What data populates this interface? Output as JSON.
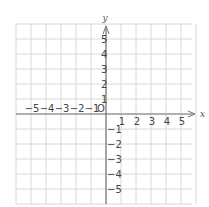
{
  "diagram": {
    "type": "coordinate-plane",
    "axes": {
      "x_label": "x",
      "y_label": "y",
      "origin_label": "O",
      "x_ticks": [
        "-5",
        "-4",
        "-3",
        "-2",
        "-1",
        "1",
        "2",
        "3",
        "4",
        "5"
      ],
      "y_ticks": [
        "5",
        "4",
        "3",
        "2",
        "1",
        "-1",
        "-2",
        "-3",
        "-4",
        "-5"
      ],
      "x_range": [
        -6,
        6
      ],
      "y_range": [
        -6,
        6
      ]
    },
    "colors": {
      "grid": "#d8d8d8",
      "axis": "#777777",
      "text": "#444444"
    },
    "grid": true
  }
}
